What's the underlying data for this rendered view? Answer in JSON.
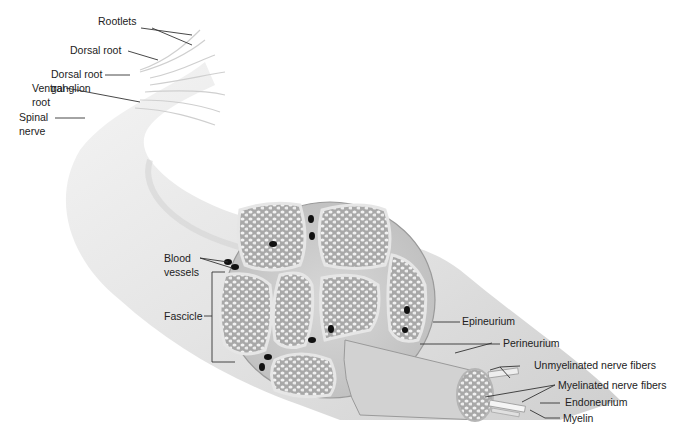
{
  "labels": {
    "rootlets": "Rootlets",
    "dorsal_root": "Dorsal root",
    "drg_line1": "Dorsal root",
    "drg_line2": "ganglion",
    "ventral_line1": "Ventral",
    "ventral_line2": "root",
    "spinal_line1": "Spinal",
    "spinal_line2": "nerve",
    "blood_line1": "Blood",
    "blood_line2": "vessels",
    "fascicle": "Fascicle",
    "epineurium": "Epineurium",
    "perineurium": "Perineurium",
    "unmyelinated": "Unmyelinated nerve fibers",
    "myelinated": "Myelinated nerve fibers",
    "endoneurium": "Endoneurium",
    "myelin": "Myelin"
  }
}
